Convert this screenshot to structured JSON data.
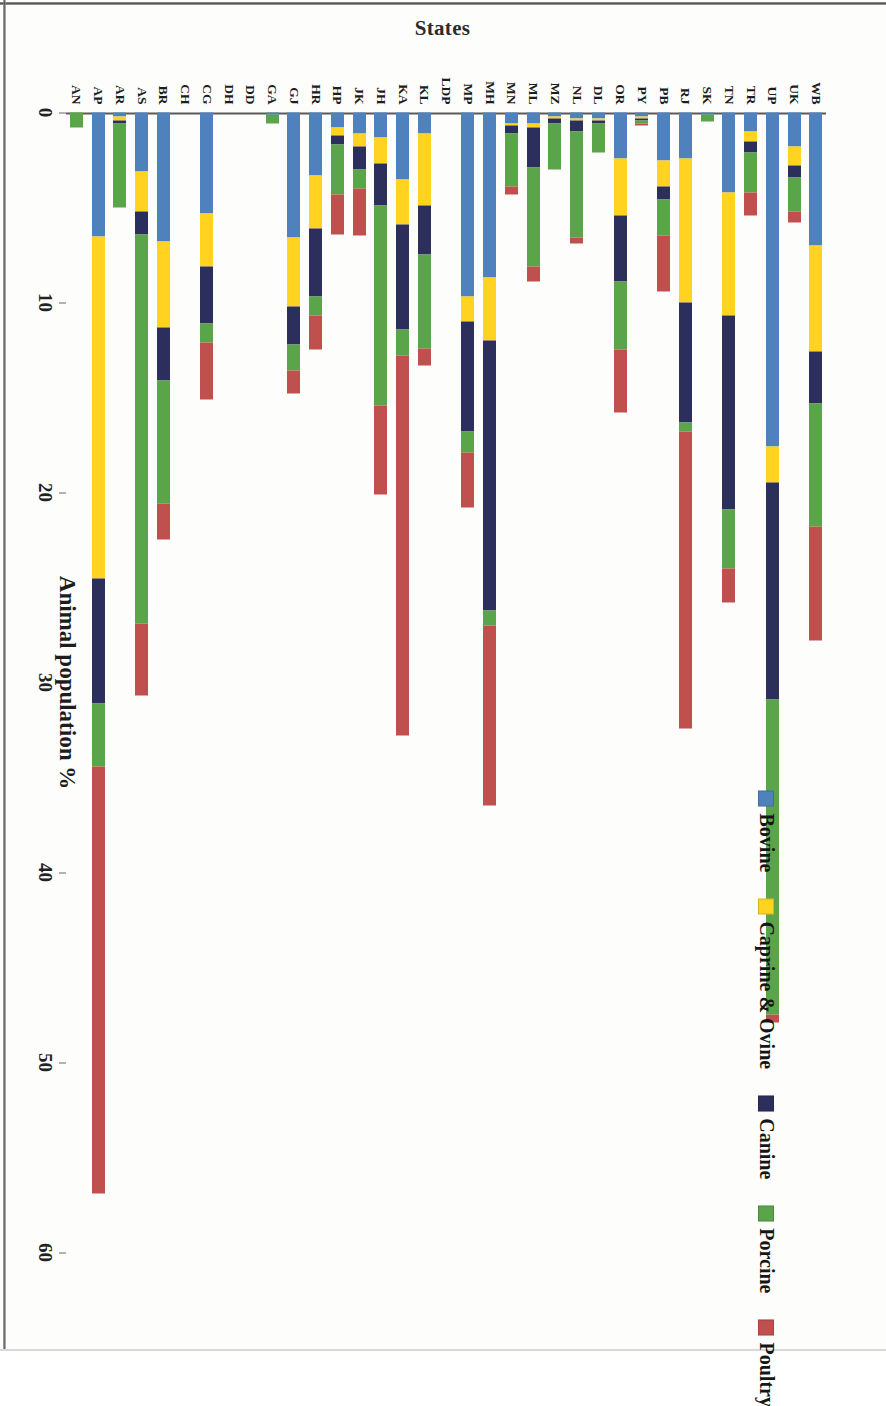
{
  "figure": {
    "orientation_note": "rotated-90",
    "background": "#ffffff"
  },
  "chart_data": {
    "type": "bar",
    "subtype": "horizontal-stacked",
    "title": "",
    "xlabel": "Animal population %",
    "ylabel": "States",
    "xlim": [
      0,
      60
    ],
    "xticks": [
      0,
      10,
      20,
      30,
      40,
      50,
      60
    ],
    "grid": false,
    "legend_position": "top-right",
    "categories": [
      "WB",
      "UK",
      "UP",
      "TR",
      "TN",
      "SK",
      "RJ",
      "PB",
      "PY",
      "OR",
      "DL",
      "NL",
      "MZ",
      "ML",
      "MN",
      "MH",
      "MP",
      "LDP",
      "KL",
      "KA",
      "JH",
      "JK",
      "HP",
      "HR",
      "GJ",
      "GA",
      "DD",
      "DH",
      "CG",
      "CH",
      "BR",
      "AS",
      "AR",
      "AP",
      "AN"
    ],
    "series": [
      {
        "name": "Bovine",
        "color": "#4f81bd",
        "values": [
          7.0,
          1.8,
          17.6,
          1.0,
          4.2,
          0.1,
          2.4,
          2.5,
          0.2,
          2.4,
          0.3,
          0.3,
          0.2,
          0.6,
          0.6,
          8.7,
          9.7,
          0.0,
          1.1,
          3.5,
          1.3,
          1.1,
          0.8,
          3.3,
          6.6,
          0.1,
          0.0,
          0.0,
          5.3,
          0.0,
          6.8,
          3.1,
          0.2,
          6.5,
          0.0
        ]
      },
      {
        "name": "Caprine & Ovine",
        "color": "#ffd320",
        "values": [
          5.6,
          1.0,
          1.9,
          0.5,
          6.5,
          0.0,
          7.6,
          1.4,
          0.1,
          3.0,
          0.1,
          0.1,
          0.1,
          0.2,
          0.1,
          3.3,
          1.3,
          0.0,
          3.8,
          2.4,
          1.4,
          0.7,
          0.4,
          2.8,
          3.6,
          0.0,
          0.0,
          0.0,
          2.8,
          0.0,
          4.5,
          2.1,
          0.2,
          18.0,
          0.0
        ]
      },
      {
        "name": "Canine",
        "color": "#2c2f5c",
        "values": [
          2.7,
          0.6,
          11.4,
          0.6,
          10.2,
          0.0,
          6.3,
          0.7,
          0.1,
          3.5,
          0.2,
          0.6,
          0.3,
          2.1,
          0.4,
          14.2,
          5.8,
          0.0,
          2.6,
          5.5,
          2.2,
          1.2,
          0.5,
          3.6,
          2.0,
          0.0,
          0.0,
          0.0,
          3.0,
          0.0,
          2.8,
          1.2,
          0.2,
          6.6,
          0.0
        ]
      },
      {
        "name": "Porcine",
        "color": "#5aa44a",
        "values": [
          6.5,
          1.8,
          16.6,
          2.1,
          3.1,
          0.4,
          0.5,
          1.9,
          0.2,
          3.6,
          1.5,
          5.6,
          2.4,
          5.2,
          2.8,
          0.8,
          1.1,
          0.0,
          4.9,
          1.4,
          10.5,
          1.0,
          2.6,
          1.0,
          1.4,
          0.5,
          0.0,
          0.0,
          1.0,
          0.0,
          6.5,
          20.5,
          4.4,
          3.3,
          0.8
        ]
      },
      {
        "name": "Poultry",
        "color": "#c0504d",
        "values": [
          6.0,
          0.6,
          0.4,
          1.2,
          1.8,
          0.0,
          15.6,
          2.9,
          0.1,
          3.3,
          0.0,
          0.3,
          0.0,
          0.8,
          0.4,
          9.5,
          2.9,
          0.0,
          0.9,
          20.0,
          4.7,
          2.5,
          2.1,
          1.8,
          1.2,
          0.0,
          0.0,
          0.0,
          3.0,
          0.0,
          1.9,
          3.8,
          0.0,
          22.5,
          0.0
        ]
      }
    ]
  },
  "legend": {
    "items": [
      {
        "label": "Bovine",
        "color": "#4f81bd"
      },
      {
        "label": "Caprine & Ovine",
        "color": "#ffd320"
      },
      {
        "label": "Canine",
        "color": "#2c2f5c"
      },
      {
        "label": "Porcine",
        "color": "#5aa44a"
      },
      {
        "label": "Poultry",
        "color": "#c0504d"
      }
    ]
  },
  "axes": {
    "x_title": "Animal population %",
    "y_title": "States",
    "x_tick_labels": [
      "0",
      "10",
      "20",
      "30",
      "40",
      "50",
      "60"
    ]
  }
}
